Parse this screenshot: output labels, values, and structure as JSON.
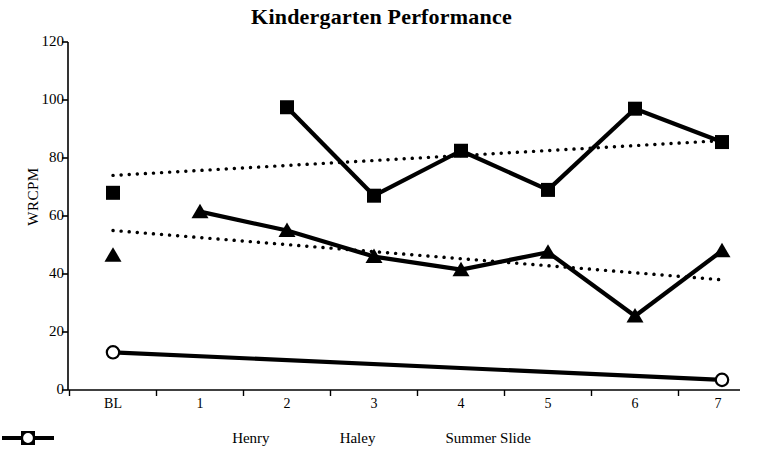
{
  "chart_data": {
    "type": "line",
    "title": "Kindergarten Performance",
    "xlabel": "",
    "ylabel": "WRCPM",
    "categories": [
      "BL",
      "1",
      "2",
      "3",
      "4",
      "5",
      "6",
      "7"
    ],
    "ylim": [
      0,
      120
    ],
    "yticks": [
      0,
      20,
      40,
      60,
      80,
      100,
      120
    ],
    "grid": false,
    "legend_position": "bottom",
    "series": [
      {
        "name": "Henry",
        "marker": "triangle",
        "line_style": "solid",
        "x": [
          "BL",
          "1",
          "2",
          "3",
          "4",
          "5",
          "6",
          "7"
        ],
        "values": [
          46.5,
          61.5,
          55,
          46,
          41.5,
          47.5,
          25.5,
          48
        ],
        "baseline_detached": true
      },
      {
        "name": "Haley",
        "marker": "square",
        "line_style": "solid",
        "x": [
          "BL",
          "1",
          "2",
          "3",
          "4",
          "5",
          "6",
          "7"
        ],
        "values": [
          68,
          null,
          97.5,
          67,
          82.5,
          69,
          97,
          85.5
        ],
        "baseline_detached": true
      },
      {
        "name": "Summer Slide",
        "marker": "circle",
        "line_style": "solid",
        "x": [
          "BL",
          "7"
        ],
        "values": [
          13,
          3.5
        ],
        "baseline_detached": false
      }
    ],
    "trendlines": [
      {
        "name": "Haley trendline",
        "line_style": "dotted",
        "from": {
          "x": "BL",
          "y": 74
        },
        "to": {
          "x": "7",
          "y": 86
        }
      },
      {
        "name": "Henry trendline",
        "line_style": "dotted",
        "from": {
          "x": "BL",
          "y": 55
        },
        "to": {
          "x": "7",
          "y": 38
        }
      }
    ],
    "colors": {
      "series": "#000000",
      "axis": "#000000",
      "background": "#ffffff"
    }
  },
  "axis": {
    "y_ticks": [
      "120",
      "100",
      "80",
      "60",
      "40",
      "20",
      "0"
    ],
    "x_ticks": [
      "BL",
      "1",
      "2",
      "3",
      "4",
      "5",
      "6",
      "7"
    ],
    "y_title": "WRCPM"
  },
  "legend": {
    "items": [
      {
        "label": "Henry",
        "marker": "triangle"
      },
      {
        "label": "Haley",
        "marker": "square"
      },
      {
        "label": "Summer Slide",
        "marker": "circle"
      }
    ]
  },
  "header": {
    "title": "Kindergarten Performance"
  }
}
